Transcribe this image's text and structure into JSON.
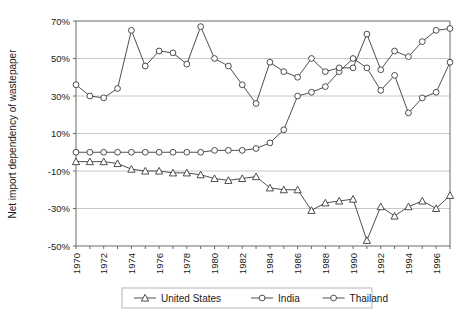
{
  "chart_data": {
    "type": "line",
    "title": "",
    "xlabel": "",
    "ylabel": "Net import dependency of wastepaper",
    "x": [
      1970,
      1971,
      1972,
      1973,
      1974,
      1975,
      1976,
      1977,
      1978,
      1979,
      1980,
      1981,
      1982,
      1983,
      1984,
      1985,
      1986,
      1987,
      1988,
      1989,
      1990,
      1991,
      1992,
      1993,
      1994,
      1995,
      1996,
      1997
    ],
    "xtick_labels": [
      "1970",
      "1972",
      "1974",
      "1976",
      "1978",
      "1980",
      "1982",
      "1984",
      "1986",
      "1988",
      "1990",
      "1992",
      "1994",
      "1996"
    ],
    "xlim": [
      1970,
      1997
    ],
    "ylim": [
      -50,
      70
    ],
    "ytick_labels": [
      "-50%",
      "-30%",
      "-10%",
      "10%",
      "30%",
      "50%",
      "70%"
    ],
    "ytick_values": [
      -50,
      -30,
      -10,
      10,
      30,
      50,
      70
    ],
    "grid": "horizontal",
    "legend_position": "bottom-center",
    "series": [
      {
        "name": "United States",
        "marker": "triangle",
        "values": [
          -5,
          -5,
          -5,
          -6,
          -9,
          -10,
          -10,
          -11,
          -11,
          -12,
          -14,
          -15,
          -14,
          -13,
          -19,
          -20,
          -20,
          -31,
          -27,
          -26,
          -25,
          -47,
          -29,
          -34,
          -29,
          -26,
          -30,
          -23
        ]
      },
      {
        "name": "India",
        "marker": "circle",
        "values": [
          0,
          0,
          0,
          0,
          0,
          0,
          0,
          0,
          0,
          0,
          1,
          1,
          1,
          2,
          5,
          12,
          30,
          32,
          35,
          43,
          50,
          45,
          33,
          41,
          21,
          29,
          32,
          48
        ]
      },
      {
        "name": "Thailand",
        "marker": "circle",
        "values": [
          36,
          30,
          29,
          34,
          65,
          46,
          54,
          53,
          47,
          67,
          50,
          46,
          36,
          26,
          48,
          43,
          40,
          50,
          43,
          45,
          45,
          63,
          44,
          54,
          51,
          59,
          65,
          66
        ]
      }
    ]
  },
  "legend": {
    "items": [
      {
        "label": "United States",
        "marker": "triangle"
      },
      {
        "label": "India",
        "marker": "circle"
      },
      {
        "label": "Thailand",
        "marker": "circle"
      }
    ]
  },
  "colors": {
    "line": "#3a3a3a",
    "grid": "#c8c8c8",
    "axis": "#6b6b6b",
    "marker_fill": "#ffffff",
    "background": "#ffffff"
  }
}
